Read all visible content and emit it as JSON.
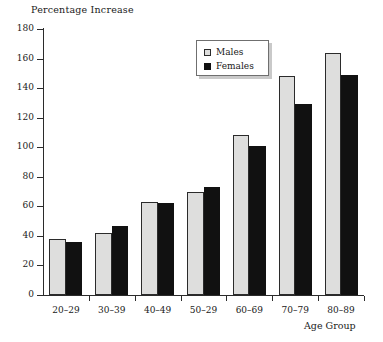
{
  "chart_data": {
    "type": "bar",
    "title": "",
    "ylabel": "Percentage Increase",
    "xlabel": "Age Group",
    "categories": [
      "20–29",
      "30–39",
      "40–49",
      "50–29",
      "60–69",
      "70–79",
      "80–89"
    ],
    "series": [
      {
        "name": "Males",
        "color": "#dededd",
        "values": [
          38,
          42,
          63,
          70,
          108,
          148,
          164
        ]
      },
      {
        "name": "Females",
        "color": "#111111",
        "values": [
          36,
          47,
          62,
          73,
          101,
          129,
          149
        ]
      }
    ],
    "ylim": [
      0,
      180
    ],
    "ytick_step": 20,
    "yticks": [
      "0",
      "20",
      "40",
      "60",
      "80",
      "100",
      "120",
      "140",
      "160",
      "180"
    ],
    "grid": false,
    "legend_position": "top-center-right"
  }
}
